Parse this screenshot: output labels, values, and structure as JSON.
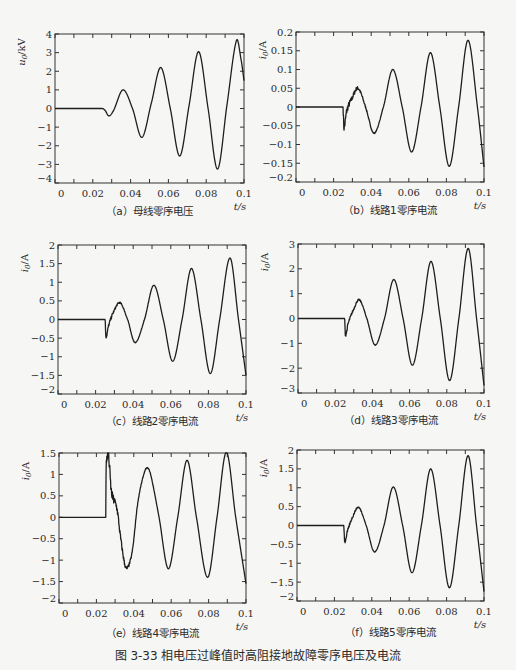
{
  "figure_caption": "图 3-33   相电压过峰值时高阻接地故障零序电压及电流",
  "chart_data": [
    {
      "id": "a",
      "type": "line",
      "caption": "（a）母线零序电压",
      "ylabel": "u0/kV",
      "ylabel_main": "u",
      "ylabel_sub": "0",
      "ylabel_unit": "/kV",
      "xlabel": "t/s",
      "xlim": [
        0,
        0.1
      ],
      "ylim": [
        -4,
        4
      ],
      "xticks": [
        0,
        0.02,
        0.04,
        0.06,
        0.08,
        0.1
      ],
      "xtick_labels": [
        "0",
        "0.02",
        "0.04",
        "0.06",
        "0.08",
        "0.1"
      ],
      "yticks": [
        -4,
        -3,
        -2,
        -1,
        0,
        1,
        2,
        3,
        4
      ],
      "ytick_labels": [
        "−4",
        "−3",
        "−2",
        "−1",
        "0",
        "1",
        "2",
        "3",
        "4"
      ],
      "grid": false,
      "fault_time": 0.025,
      "noise": 0,
      "series": [
        {
          "name": "u0",
          "points": [
            [
              0,
              0
            ],
            [
              0.025,
              0
            ],
            [
              0.0265,
              -0.1
            ],
            [
              0.0285,
              -0.4
            ],
            [
              0.031,
              -0.1
            ],
            [
              0.036,
              1.0
            ],
            [
              0.041,
              0.0
            ],
            [
              0.046,
              -1.55
            ],
            [
              0.051,
              0.3
            ],
            [
              0.056,
              2.2
            ],
            [
              0.061,
              0.0
            ],
            [
              0.066,
              -2.55
            ],
            [
              0.071,
              0.2
            ],
            [
              0.076,
              3.05
            ],
            [
              0.081,
              0.0
            ],
            [
              0.086,
              -3.25
            ],
            [
              0.091,
              0.2
            ],
            [
              0.096,
              3.65
            ],
            [
              0.0985,
              2.6
            ],
            [
              0.1,
              1.5
            ]
          ]
        }
      ]
    },
    {
      "id": "b",
      "type": "line",
      "caption": "（b）线路1零序电流",
      "ylabel": "i0/A",
      "ylabel_main": "i",
      "ylabel_sub": "0",
      "ylabel_unit": "/A",
      "xlabel": "t/s",
      "xlim": [
        0,
        0.1
      ],
      "ylim": [
        -0.2,
        0.2
      ],
      "xticks": [
        0,
        0.02,
        0.04,
        0.06,
        0.08,
        0.1
      ],
      "xtick_labels": [
        "0",
        "0.02",
        "0.04",
        "0.06",
        "0.08",
        "0.1"
      ],
      "yticks": [
        -0.2,
        -0.15,
        -0.1,
        -0.05,
        0,
        0.05,
        0.1,
        0.15,
        0.2
      ],
      "ytick_labels": [
        "−0.2",
        "−0.15",
        "−0.1",
        "−0.05",
        "0",
        "0.05",
        "0.1",
        "0.15",
        "0.2"
      ],
      "grid": false,
      "fault_time": 0.025,
      "noise": 0.012,
      "series": [
        {
          "name": "i0",
          "points": [
            [
              0,
              0
            ],
            [
              0.025,
              0
            ],
            [
              0.0255,
              -0.055
            ],
            [
              0.027,
              -0.01
            ],
            [
              0.0295,
              0.02
            ],
            [
              0.033,
              0.05
            ],
            [
              0.037,
              0.0
            ],
            [
              0.0415,
              -0.07
            ],
            [
              0.0465,
              0.0
            ],
            [
              0.0515,
              0.1
            ],
            [
              0.0565,
              0.0
            ],
            [
              0.0615,
              -0.12
            ],
            [
              0.0665,
              0.0
            ],
            [
              0.0715,
              0.145
            ],
            [
              0.0765,
              0.0
            ],
            [
              0.0815,
              -0.158
            ],
            [
              0.0865,
              0.0
            ],
            [
              0.0915,
              0.178
            ],
            [
              0.0965,
              0.0
            ],
            [
              0.1,
              -0.16
            ]
          ]
        }
      ]
    },
    {
      "id": "c",
      "type": "line",
      "caption": "（c）线路2零序电流",
      "ylabel": "i0/A",
      "ylabel_main": "i",
      "ylabel_sub": "0",
      "ylabel_unit": "/A",
      "xlabel": "t/s",
      "xlim": [
        0,
        0.1
      ],
      "ylim": [
        -2,
        2
      ],
      "xticks": [
        0,
        0.02,
        0.04,
        0.06,
        0.08,
        0.1
      ],
      "xtick_labels": [
        "0",
        "0.02",
        "0.04",
        "0.06",
        "0.08",
        "0.1"
      ],
      "yticks": [
        -2,
        -1.5,
        -1,
        -0.5,
        0,
        0.5,
        1,
        1.5,
        2
      ],
      "ytick_labels": [
        "−2",
        "−1.5",
        "−1",
        "−0.5",
        "0",
        "0.5",
        "1",
        "1.5",
        "2"
      ],
      "grid": false,
      "fault_time": 0.025,
      "noise": 0.06,
      "series": [
        {
          "name": "i0",
          "points": [
            [
              0,
              0
            ],
            [
              0.025,
              0
            ],
            [
              0.0255,
              -0.45
            ],
            [
              0.027,
              -0.15
            ],
            [
              0.0295,
              0.2
            ],
            [
              0.033,
              0.45
            ],
            [
              0.037,
              0.0
            ],
            [
              0.041,
              -0.62
            ],
            [
              0.046,
              0.0
            ],
            [
              0.051,
              0.92
            ],
            [
              0.056,
              0.0
            ],
            [
              0.061,
              -1.12
            ],
            [
              0.066,
              0.0
            ],
            [
              0.071,
              1.37
            ],
            [
              0.076,
              0.0
            ],
            [
              0.081,
              -1.45
            ],
            [
              0.086,
              0.0
            ],
            [
              0.0915,
              1.65
            ],
            [
              0.096,
              0.0
            ],
            [
              0.1,
              -1.5
            ]
          ]
        }
      ]
    },
    {
      "id": "d",
      "type": "line",
      "caption": "（d）线路3零序电流",
      "ylabel": "i0/A",
      "ylabel_main": "i",
      "ylabel_sub": "0",
      "ylabel_unit": "/A",
      "xlabel": "t/s",
      "xlim": [
        0,
        0.1
      ],
      "ylim": [
        -3,
        3
      ],
      "xticks": [
        0,
        0.02,
        0.04,
        0.06,
        0.08,
        0.1
      ],
      "xtick_labels": [
        "0",
        "0.02",
        "0.04",
        "0.06",
        "0.08",
        "0.1"
      ],
      "yticks": [
        -3,
        -2,
        -1,
        0,
        1,
        2,
        3
      ],
      "ytick_labels": [
        "−3",
        "−2",
        "−1",
        "0",
        "1",
        "2",
        "3"
      ],
      "grid": false,
      "fault_time": 0.025,
      "noise": 0.08,
      "series": [
        {
          "name": "i0",
          "points": [
            [
              0,
              0
            ],
            [
              0.025,
              0
            ],
            [
              0.0255,
              -0.65
            ],
            [
              0.027,
              -0.2
            ],
            [
              0.0295,
              0.3
            ],
            [
              0.033,
              0.75
            ],
            [
              0.037,
              0.0
            ],
            [
              0.0415,
              -1.07
            ],
            [
              0.0465,
              0.0
            ],
            [
              0.0515,
              1.57
            ],
            [
              0.0565,
              0.0
            ],
            [
              0.0615,
              -1.88
            ],
            [
              0.0665,
              0.0
            ],
            [
              0.0715,
              2.3
            ],
            [
              0.0765,
              0.0
            ],
            [
              0.0815,
              -2.5
            ],
            [
              0.0865,
              0.0
            ],
            [
              0.0915,
              2.82
            ],
            [
              0.096,
              0.0
            ],
            [
              0.1,
              -2.7
            ]
          ]
        }
      ]
    },
    {
      "id": "e",
      "type": "line",
      "caption": "（e）线路4零序电流",
      "ylabel": "i0/A",
      "ylabel_main": "i",
      "ylabel_sub": "0",
      "ylabel_unit": "/A",
      "xlabel": "t/s",
      "xlim": [
        0,
        0.1
      ],
      "ylim": [
        -2,
        1.5
      ],
      "xticks": [
        0,
        0.02,
        0.04,
        0.06,
        0.08,
        0.1
      ],
      "xtick_labels": [
        "0",
        "0.02",
        "0.04",
        "0.06",
        "0.08",
        "0.1"
      ],
      "yticks": [
        -2,
        -1.5,
        -1,
        -0.5,
        0,
        0.5,
        1,
        1.5
      ],
      "ytick_labels": [
        "−2",
        "−1.5",
        "−1",
        "−0.5",
        "0",
        "0.5",
        "1",
        "1.5"
      ],
      "grid": false,
      "fault_time": 0.025,
      "noise": 0.18,
      "series": [
        {
          "name": "i0",
          "points": [
            [
              0,
              0
            ],
            [
              0.025,
              0
            ],
            [
              0.0252,
              1.15
            ],
            [
              0.0265,
              1.4
            ],
            [
              0.028,
              0.6
            ],
            [
              0.031,
              0.2
            ],
            [
              0.033,
              -0.5
            ],
            [
              0.0355,
              -1.15
            ],
            [
              0.0375,
              -1.1
            ],
            [
              0.0395,
              -0.7
            ],
            [
              0.042,
              0.3
            ],
            [
              0.045,
              0.95
            ],
            [
              0.047,
              1.15
            ],
            [
              0.049,
              1.0
            ],
            [
              0.0535,
              0.0
            ],
            [
              0.0585,
              -1.2
            ],
            [
              0.0635,
              0.0
            ],
            [
              0.0685,
              1.33
            ],
            [
              0.0735,
              0.0
            ],
            [
              0.0795,
              -1.4
            ],
            [
              0.0845,
              0.0
            ],
            [
              0.0895,
              1.52
            ],
            [
              0.0945,
              0.0
            ],
            [
              0.1,
              -1.55
            ]
          ]
        }
      ]
    },
    {
      "id": "f",
      "type": "line",
      "caption": "（f）线路5零序电流",
      "ylabel": "i0/A",
      "ylabel_main": "i",
      "ylabel_sub": "0",
      "ylabel_unit": "/A",
      "xlabel": "t/s",
      "xlim": [
        0,
        0.1
      ],
      "ylim": [
        -2,
        2
      ],
      "xticks": [
        0,
        0.02,
        0.04,
        0.06,
        0.08,
        0.1
      ],
      "xtick_labels": [
        "0",
        "0.02",
        "0.04",
        "0.06",
        "0.08",
        "0.1"
      ],
      "yticks": [
        -2,
        -1.5,
        -1,
        -0.5,
        0,
        0.5,
        1,
        1.5,
        2
      ],
      "ytick_labels": [
        "−2",
        "−1.5",
        "−1",
        "−0.5",
        "0",
        "0.5",
        "1",
        "1.5",
        "2"
      ],
      "grid": false,
      "fault_time": 0.025,
      "noise": 0.05,
      "series": [
        {
          "name": "i0",
          "points": [
            [
              0,
              0
            ],
            [
              0.025,
              0
            ],
            [
              0.0255,
              -0.42
            ],
            [
              0.027,
              -0.15
            ],
            [
              0.0295,
              0.2
            ],
            [
              0.033,
              0.48
            ],
            [
              0.037,
              0.0
            ],
            [
              0.0415,
              -0.7
            ],
            [
              0.0465,
              0.0
            ],
            [
              0.0515,
              1.02
            ],
            [
              0.0565,
              0.0
            ],
            [
              0.0615,
              -1.25
            ],
            [
              0.0665,
              0.0
            ],
            [
              0.0715,
              1.5
            ],
            [
              0.0765,
              0.0
            ],
            [
              0.0815,
              -1.65
            ],
            [
              0.0865,
              0.0
            ],
            [
              0.0915,
              1.85
            ],
            [
              0.096,
              0.0
            ],
            [
              0.1,
              -1.75
            ]
          ]
        }
      ]
    }
  ]
}
